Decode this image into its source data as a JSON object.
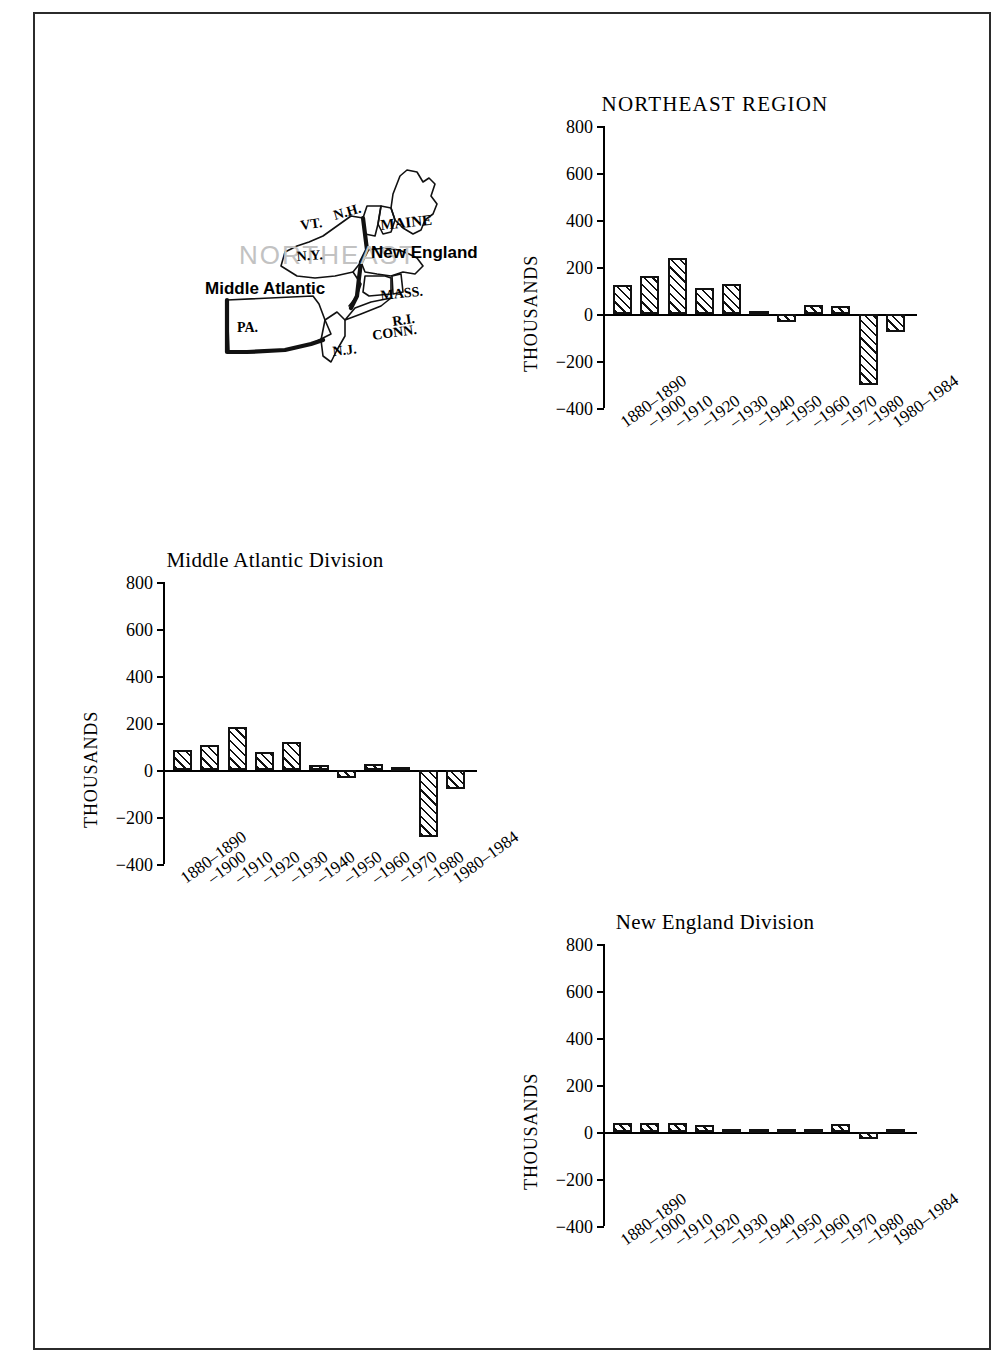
{
  "page": {
    "background": "#ffffff",
    "frame_color": "#2b2b2b"
  },
  "map": {
    "name": "northeast-region-map",
    "watermark": "NORTHEAST",
    "watermark_color": "#c2c2c2",
    "division_labels": [
      {
        "id": "new-england",
        "text": "New England"
      },
      {
        "id": "middle-atlantic",
        "text": "Middle Atlantic"
      }
    ],
    "state_labels": [
      {
        "id": "vt",
        "text": "VT."
      },
      {
        "id": "nh",
        "text": "N.H."
      },
      {
        "id": "maine",
        "text": "MAINE"
      },
      {
        "id": "ny",
        "text": "N.Y."
      },
      {
        "id": "mass",
        "text": "MASS."
      },
      {
        "id": "ri",
        "text": "R.I."
      },
      {
        "id": "conn",
        "text": "CONN."
      },
      {
        "id": "pa",
        "text": "PA."
      },
      {
        "id": "nj",
        "text": "N.J."
      }
    ]
  },
  "axis": {
    "y_title": "THOUSANDS",
    "y_ticks": [
      "800",
      "600",
      "400",
      "200",
      "0",
      "−200",
      "−400"
    ],
    "y_values": [
      800,
      600,
      400,
      200,
      0,
      -200,
      -400
    ],
    "x_categories": [
      "1880–1890",
      "–1900",
      "–1910",
      "–1920",
      "–1930",
      "–1940",
      "–1950",
      "–1960",
      "–1970",
      "–1980",
      "1980–1984"
    ]
  },
  "chart_data": [
    {
      "id": "northeast-region",
      "type": "bar",
      "title": "NORTHEAST REGION",
      "xlabel": "",
      "ylabel": "THOUSANDS",
      "ylim": [
        -400,
        800
      ],
      "grid": false,
      "legend": "none",
      "categories": [
        "1880–1890",
        "–1900",
        "–1910",
        "–1920",
        "–1930",
        "–1940",
        "–1950",
        "–1960",
        "–1970",
        "–1980",
        "1980–1984"
      ],
      "values": [
        122,
        163,
        240,
        110,
        128,
        6,
        -32,
        38,
        36,
        -300,
        -75
      ]
    },
    {
      "id": "middle-atlantic-division",
      "type": "bar",
      "title": "Middle Atlantic Division",
      "xlabel": "",
      "ylabel": "THOUSANDS",
      "ylim": [
        -400,
        800
      ],
      "grid": false,
      "legend": "none",
      "categories": [
        "1880–1890",
        "–1900",
        "–1910",
        "–1920",
        "–1930",
        "–1940",
        "–1950",
        "–1960",
        "–1970",
        "–1980",
        "1980–1984"
      ],
      "values": [
        84,
        105,
        182,
        78,
        118,
        20,
        -36,
        24,
        10,
        -285,
        -80
      ]
    },
    {
      "id": "new-england-division",
      "type": "bar",
      "title": "New England Division",
      "xlabel": "",
      "ylabel": "THOUSANDS",
      "ylim": [
        -400,
        800
      ],
      "grid": false,
      "legend": "none",
      "categories": [
        "1880–1890",
        "–1900",
        "–1910",
        "–1920",
        "–1930",
        "–1940",
        "–1950",
        "–1960",
        "–1970",
        "–1980",
        "1980–1984"
      ],
      "values": [
        38,
        40,
        38,
        30,
        8,
        0,
        6,
        12,
        36,
        -30,
        6
      ]
    }
  ]
}
